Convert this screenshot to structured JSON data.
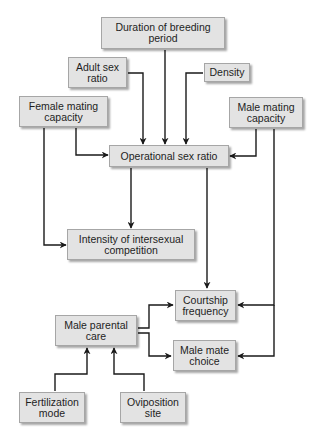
{
  "diagram": {
    "type": "flowchart",
    "colors": {
      "box_fill": "#e3e3e3",
      "box_border": "#a6a6a6",
      "line": "#1a1a1a",
      "text": "#1e1e1e",
      "background": "#ffffff"
    },
    "nodes": {
      "duration": {
        "label": "Duration of breeding period"
      },
      "adult_sex_ratio": {
        "label": "Adult sex ratio"
      },
      "density": {
        "label": "Density"
      },
      "female_mating_capacity": {
        "label": "Female mating capacity"
      },
      "male_mating_capacity": {
        "label": "Male mating capacity"
      },
      "operational_sex_ratio": {
        "label": "Operational sex ratio"
      },
      "intensity": {
        "label": "Intensity of intersexual competition"
      },
      "courtship_frequency": {
        "label": "Courtship frequency"
      },
      "male_parental_care": {
        "label": "Male parental care"
      },
      "male_mate_choice": {
        "label": "Male mate choice"
      },
      "fertilization_mode": {
        "label": "Fertilization mode"
      },
      "oviposition_site": {
        "label": "Oviposition site"
      }
    },
    "edges": [
      {
        "from": "Duration of breeding period",
        "to": "Operational sex ratio"
      },
      {
        "from": "Adult sex ratio",
        "to": "Operational sex ratio"
      },
      {
        "from": "Density",
        "to": "Operational sex ratio"
      },
      {
        "from": "Female mating capacity",
        "to": "Operational sex ratio"
      },
      {
        "from": "Female mating capacity",
        "to": "Intensity of intersexual competition"
      },
      {
        "from": "Male mating capacity",
        "to": "Operational sex ratio"
      },
      {
        "from": "Male mating capacity",
        "to": "Courtship frequency"
      },
      {
        "from": "Male mating capacity",
        "to": "Male mate choice"
      },
      {
        "from": "Operational sex ratio",
        "to": "Intensity of intersexual competition"
      },
      {
        "from": "Operational sex ratio",
        "to": "Courtship frequency"
      },
      {
        "from": "Male parental care",
        "to": "Courtship frequency"
      },
      {
        "from": "Male parental care",
        "to": "Male mate choice"
      },
      {
        "from": "Fertilization mode",
        "to": "Male parental care"
      },
      {
        "from": "Oviposition site",
        "to": "Male parental care"
      }
    ]
  }
}
